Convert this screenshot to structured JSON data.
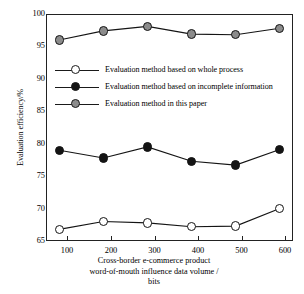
{
  "chart_data": {
    "type": "line",
    "title": "",
    "xlabel": "Cross-border e-commerce product word-of-mouth influence data volume / bits",
    "xlabel_lines": [
      "Cross-border e-commerce product",
      "word-of-mouth influence data volume /",
      "bits"
    ],
    "ylabel": "Evaluation efficiency/%",
    "x": [
      100,
      200,
      300,
      400,
      500,
      600
    ],
    "categories": [
      "100",
      "200",
      "300",
      "400",
      "500",
      "600"
    ],
    "xlim": [
      70,
      630
    ],
    "ylim": [
      65,
      100
    ],
    "yticks": [
      65,
      70,
      75,
      80,
      85,
      90,
      95,
      100
    ],
    "ytick_labels": [
      "65",
      "70",
      "75",
      "80",
      "85",
      "90",
      "95",
      "100"
    ],
    "grid": false,
    "legend_position": "upper-left-inside",
    "series": [
      {
        "name": "Evaluation method based on whole process",
        "marker": "open-circle",
        "color": "#ffffff",
        "edge_color": "#141414",
        "values": [
          66.8,
          68.0,
          67.8,
          67.2,
          67.3,
          70.0
        ]
      },
      {
        "name": "Evaluation method based on incomplete information",
        "marker": "filled-circle",
        "color": "#141414",
        "edge_color": "#141414",
        "values": [
          79.0,
          77.8,
          79.5,
          77.3,
          76.7,
          79.1
        ]
      },
      {
        "name": "Evaluation method in this paper",
        "marker": "gray-circle",
        "color": "#8c8c8c",
        "edge_color": "#141414",
        "values": [
          96.0,
          97.4,
          98.1,
          96.9,
          96.8,
          97.8
        ]
      }
    ]
  },
  "legend": {
    "items": [
      {
        "label": "Evaluation method based on whole process"
      },
      {
        "label": "Evaluation method based on incomplete information"
      },
      {
        "label": "Evaluation method in this paper"
      }
    ]
  },
  "axes": {
    "y_title": "Evaluation efficiency/%",
    "x_title_line1": "Cross-border e-commerce product",
    "x_title_line2": "word-of-mouth influence data volume /",
    "x_title_line3": "bits",
    "y_labels": [
      "100",
      "95",
      "90",
      "85",
      "80",
      "75",
      "70",
      "65"
    ],
    "x_labels": [
      "100",
      "200",
      "300",
      "400",
      "500",
      "600"
    ]
  },
  "colors": {
    "axis": "#222222",
    "line": "#1a1a1a",
    "marker_open": "#ffffff",
    "marker_filled": "#141414",
    "marker_gray": "#8c8c8c",
    "background": "#ffffff"
  }
}
